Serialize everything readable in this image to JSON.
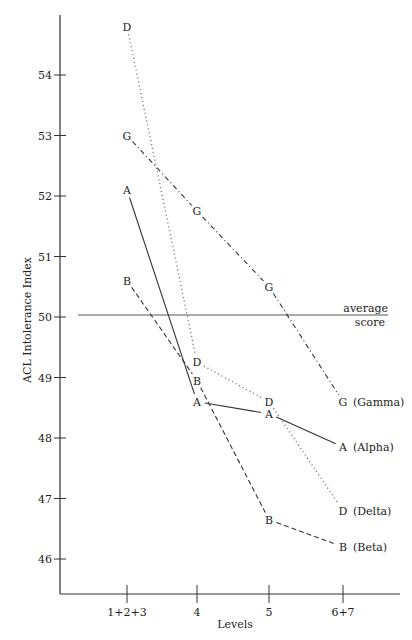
{
  "chart_data": {
    "type": "line",
    "title": "",
    "xlabel": "Levels",
    "ylabel": "ACL Intolerance Index",
    "categories": [
      "1+2+3",
      "4",
      "5",
      "6+7"
    ],
    "yticks": [
      46,
      47,
      48,
      49,
      50,
      51,
      52,
      53,
      54
    ],
    "ylim": [
      45.6,
      55.1
    ],
    "grid": false,
    "reference_line": {
      "value": 50,
      "label_line1": "average",
      "label_line2": "score"
    },
    "series": [
      {
        "name": "Gamma",
        "marker": "G",
        "style": "dashdot",
        "values": [
          53.0,
          51.75,
          50.5,
          48.6
        ]
      },
      {
        "name": "Alpha",
        "marker": "A",
        "style": "solid",
        "values": [
          52.1,
          48.6,
          48.4,
          47.85
        ]
      },
      {
        "name": "Delta",
        "marker": "D",
        "style": "dotted",
        "values": [
          54.8,
          49.25,
          48.6,
          46.8
        ]
      },
      {
        "name": "Beta",
        "marker": "B",
        "style": "dashed",
        "values": [
          50.6,
          48.95,
          46.65,
          46.2
        ]
      }
    ],
    "legend_position": "end-of-lines, right"
  }
}
